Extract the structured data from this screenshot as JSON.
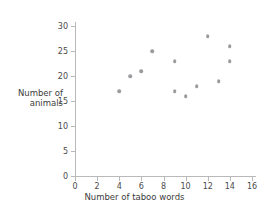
{
  "chart_data": {
    "type": "scatter",
    "title": "",
    "xlabel": "Number of taboo words",
    "ylabel_lines": [
      "Number of",
      "animals"
    ],
    "ylabel": "Number of animals",
    "xlim": [
      0,
      16
    ],
    "ylim": [
      0,
      30
    ],
    "xticks": [
      0,
      2,
      4,
      6,
      8,
      10,
      12,
      14,
      16
    ],
    "yticks": [
      0,
      5,
      10,
      15,
      20,
      25,
      30
    ],
    "grid": false,
    "legend": null,
    "point_color": "#9a9a9f",
    "axis_color": "#b9b9b9",
    "points": [
      {
        "x": 4,
        "y": 17
      },
      {
        "x": 5,
        "y": 20
      },
      {
        "x": 6,
        "y": 21
      },
      {
        "x": 7,
        "y": 25
      },
      {
        "x": 9,
        "y": 23
      },
      {
        "x": 9,
        "y": 17
      },
      {
        "x": 10,
        "y": 16
      },
      {
        "x": 11,
        "y": 18
      },
      {
        "x": 12,
        "y": 28
      },
      {
        "x": 13,
        "y": 19
      },
      {
        "x": 14,
        "y": 26
      },
      {
        "x": 14,
        "y": 23
      }
    ]
  }
}
